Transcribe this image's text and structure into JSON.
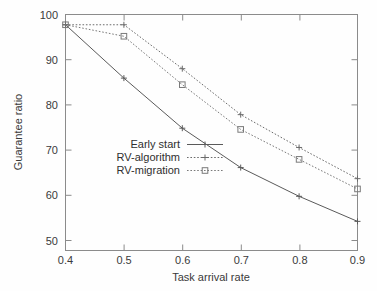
{
  "chart_data": {
    "type": "line",
    "title": "",
    "xlabel": "Task arrival rate",
    "ylabel": "Guarantee ratio",
    "x": [
      0.4,
      0.5,
      0.6,
      0.7,
      0.8,
      0.9
    ],
    "xticklabels": [
      "0.4",
      "0.5",
      "0.6",
      "0.7",
      "0.8",
      "0.9"
    ],
    "yticks": [
      50,
      60,
      70,
      80,
      90,
      100
    ],
    "yticklabels": [
      "50",
      "60",
      "70",
      "80",
      "90",
      "100"
    ],
    "xlim": [
      0.4,
      0.9
    ],
    "ylim": [
      45.0,
      102.5
    ],
    "grid": false,
    "legend_position": "center-left",
    "series": [
      {
        "name": "Early start",
        "values": [
          100,
          87.0,
          74.8,
          65.2,
          58.2,
          52.1
        ],
        "marker": "plus",
        "linestyle": "solid",
        "color": "#5a5a5a"
      },
      {
        "name": "RV-algorithm",
        "values": [
          100,
          100,
          89.3,
          78.1,
          70.1,
          62.5
        ],
        "marker": "plus",
        "linestyle": "dotted",
        "color": "#6b6b6b"
      },
      {
        "name": "RV-migration",
        "values": [
          100,
          97.2,
          85.4,
          74.5,
          67.2,
          60.0
        ],
        "marker": "square",
        "linestyle": "dotted",
        "color": "#7a7a7a"
      }
    ]
  },
  "axes": {
    "x_title": "Task arrival rate",
    "y_title": "Guarantee ratio",
    "x_ticks": [
      "0.4",
      "0.5",
      "0.6",
      "0.7",
      "0.8",
      "0.9"
    ],
    "y_ticks": [
      "100",
      "90",
      "80",
      "70",
      "60",
      "50"
    ]
  },
  "legend": {
    "entries": [
      {
        "label": "Early start"
      },
      {
        "label": "RV-algorithm"
      },
      {
        "label": "RV-migration"
      }
    ]
  },
  "colors": {
    "frame": "#8b8b8b",
    "text": "#3a3a3a",
    "series_1": "#5a5a5a",
    "series_2": "#6b6b6b",
    "series_3": "#7a7a7a",
    "background": "#fefefe"
  }
}
